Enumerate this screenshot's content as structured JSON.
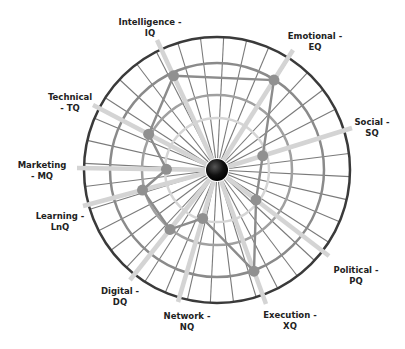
{
  "chart_data": {
    "type": "radar",
    "title": "",
    "center": [
      217,
      170
    ],
    "outer_radius": 133,
    "rings": [
      {
        "r": 133,
        "color": "#3a3a3a",
        "width": 2.5
      },
      {
        "r": 107,
        "color": "#8a8a8a",
        "width": 2.5
      },
      {
        "r": 75,
        "color": "#a0a0a0",
        "width": 2.5
      },
      {
        "r": 52,
        "color": "#d5d5d5",
        "width": 2.5
      }
    ],
    "axes": [
      {
        "name": "Intelligence - IQ",
        "line1": "Intelligence -",
        "line2": "IQ",
        "dx": -60,
        "dy": -130,
        "label_x": 150,
        "label_y": 28,
        "value": 0.78
      },
      {
        "name": "Emotional - EQ",
        "line1": "Emotional -",
        "line2": "EQ",
        "dx": 76,
        "dy": -120,
        "label_x": 315,
        "label_y": 42,
        "value": 0.8
      },
      {
        "name": "Social - SQ",
        "line1": "Social -",
        "line2": "SQ",
        "dx": 135,
        "dy": -42,
        "label_x": 372,
        "label_y": 128,
        "value": 0.36
      },
      {
        "name": "Political - PQ",
        "line1": "Political -",
        "line2": "PQ",
        "dx": 112,
        "dy": 86,
        "label_x": 356,
        "label_y": 276,
        "value": 0.37
      },
      {
        "name": "Execution - XQ",
        "line1": "Execution -",
        "line2": "XQ",
        "dx": 49,
        "dy": 134,
        "label_x": 290,
        "label_y": 321,
        "value": 0.81
      },
      {
        "name": "Network - NQ",
        "line1": "Network -",
        "line2": "NQ",
        "dx": -39,
        "dy": 132,
        "label_x": 187,
        "label_y": 322,
        "value": 0.38
      },
      {
        "name": "Digital - DQ",
        "line1": "Digital -",
        "line2": "DQ",
        "dx": -87,
        "dy": 110,
        "label_x": 120,
        "label_y": 297,
        "value": 0.57
      },
      {
        "name": "Learning - LnQ",
        "line1": "Learning -",
        "line2": "LnQ",
        "dx": -134,
        "dy": 36,
        "label_x": 60,
        "label_y": 222,
        "value": 0.58
      },
      {
        "name": "Marketing - MQ",
        "line1": "Marketing",
        "line2": "- MQ",
        "dx": -140,
        "dy": -2,
        "label_x": 42,
        "label_y": 171,
        "value": 0.38
      },
      {
        "name": "Technical - TQ",
        "line1": "Technical",
        "line2": "- TQ",
        "dx": -124,
        "dy": -65,
        "label_x": 70,
        "label_y": 103,
        "value": 0.58
      }
    ],
    "categories": [
      "Intelligence - IQ",
      "Emotional - EQ",
      "Social - SQ",
      "Political - PQ",
      "Execution - XQ",
      "Network - NQ",
      "Digital - DQ",
      "Learning - LnQ",
      "Marketing - MQ",
      "Technical - TQ"
    ],
    "values": [
      0.78,
      0.8,
      0.36,
      0.37,
      0.81,
      0.38,
      0.57,
      0.58,
      0.38,
      0.58
    ],
    "thin_spoke_count": 36,
    "colors": {
      "thick_spoke": "#d4d4d4",
      "thin_spoke": "#7a7a7a",
      "polygon": "#8c8c8c",
      "point": "#909090",
      "hub": "#111111"
    }
  }
}
